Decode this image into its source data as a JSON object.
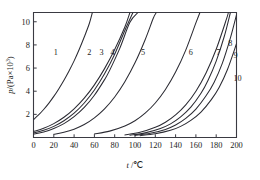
{
  "figure": {
    "name": "vapour-pressure-vs-temperature-chart",
    "background": "#ffffff",
    "curve_color": "#2b2b33",
    "axis_color": "#3a3a42"
  },
  "chart_data": {
    "type": "line",
    "title": "",
    "subtitle": "",
    "xlabel": "t /℃",
    "ylabel": "p/(Pa×10³)",
    "xlabel_symbol": "t",
    "xlabel_unit": "℃",
    "ylabel_symbol": "p",
    "ylabel_unit": "Pa×10³",
    "ylabel_mantissa": "p/(Pa×10",
    "ylabel_exponent": "3",
    "ylabel_close": ")",
    "xlim": [
      0,
      200
    ],
    "ylim": [
      0,
      10.8
    ],
    "grid": false,
    "legend": "none",
    "xticks": [
      0,
      20,
      40,
      60,
      80,
      100,
      120,
      140,
      160,
      180,
      200
    ],
    "xtick_labels": [
      "0",
      "20",
      "40",
      "60",
      "80",
      "100",
      "120",
      "140",
      "160",
      "180",
      "200"
    ],
    "yticks": [
      2,
      4,
      6,
      8,
      10
    ],
    "ytick_labels": [
      "2",
      "4",
      "6",
      "8",
      "10"
    ],
    "series": [
      {
        "name": "1",
        "label": "1",
        "label_x": 22,
        "label_y": 7.35,
        "points": [
          [
            0,
            1.55
          ],
          [
            5,
            1.95
          ],
          [
            10,
            2.42
          ],
          [
            15,
            2.95
          ],
          [
            20,
            3.55
          ],
          [
            25,
            4.22
          ],
          [
            30,
            4.95
          ],
          [
            35,
            5.75
          ],
          [
            40,
            6.62
          ],
          [
            45,
            7.6
          ],
          [
            50,
            8.68
          ],
          [
            55,
            9.85
          ],
          [
            58,
            10.8
          ]
        ]
      },
      {
        "name": "2",
        "label": "2",
        "label_x": 55,
        "label_y": 7.35,
        "points": [
          [
            0,
            0.52
          ],
          [
            10,
            0.8
          ],
          [
            20,
            1.2
          ],
          [
            30,
            1.75
          ],
          [
            40,
            2.48
          ],
          [
            50,
            3.4
          ],
          [
            60,
            4.55
          ],
          [
            70,
            5.95
          ],
          [
            80,
            7.6
          ],
          [
            90,
            9.55
          ],
          [
            95,
            10.8
          ]
        ]
      },
      {
        "name": "3",
        "label": "3",
        "label_x": 67,
        "label_y": 7.35,
        "points": [
          [
            0,
            0.4
          ],
          [
            10,
            0.62
          ],
          [
            20,
            0.96
          ],
          [
            30,
            1.45
          ],
          [
            40,
            2.1
          ],
          [
            50,
            2.98
          ],
          [
            60,
            4.1
          ],
          [
            70,
            5.5
          ],
          [
            80,
            7.2
          ],
          [
            90,
            9.25
          ],
          [
            98,
            10.8
          ]
        ]
      },
      {
        "name": "4",
        "label": "4",
        "label_x": 78,
        "label_y": 7.35,
        "points": [
          [
            0,
            0.3
          ],
          [
            10,
            0.48
          ],
          [
            20,
            0.78
          ],
          [
            30,
            1.2
          ],
          [
            40,
            1.8
          ],
          [
            50,
            2.6
          ],
          [
            60,
            3.65
          ],
          [
            70,
            5.0
          ],
          [
            75,
            5.8
          ],
          [
            85,
            7.7
          ],
          [
            95,
            9.95
          ],
          [
            103,
            10.8
          ]
        ]
      },
      {
        "name": "5",
        "label": "5",
        "label_x": 108,
        "label_y": 7.35,
        "points": [
          [
            20,
            0.28
          ],
          [
            30,
            0.45
          ],
          [
            40,
            0.72
          ],
          [
            50,
            1.12
          ],
          [
            60,
            1.7
          ],
          [
            70,
            2.48
          ],
          [
            80,
            3.5
          ],
          [
            90,
            4.82
          ],
          [
            100,
            6.45
          ],
          [
            110,
            8.45
          ],
          [
            118,
            10.3
          ],
          [
            121,
            10.8
          ]
        ]
      },
      {
        "name": "6",
        "label": "6",
        "label_x": 155,
        "label_y": 7.35,
        "points": [
          [
            60,
            0.3
          ],
          [
            75,
            0.55
          ],
          [
            90,
            1.0
          ],
          [
            100,
            1.45
          ],
          [
            110,
            2.1
          ],
          [
            120,
            2.98
          ],
          [
            130,
            4.15
          ],
          [
            140,
            5.65
          ],
          [
            150,
            7.55
          ],
          [
            160,
            9.9
          ],
          [
            164,
            10.8
          ]
        ]
      },
      {
        "name": "7",
        "label": "7",
        "label_x": 182,
        "label_y": 7.35,
        "points": [
          [
            90,
            0.22
          ],
          [
            105,
            0.45
          ],
          [
            120,
            0.88
          ],
          [
            130,
            1.32
          ],
          [
            140,
            1.95
          ],
          [
            150,
            2.82
          ],
          [
            160,
            4.0
          ],
          [
            170,
            5.58
          ],
          [
            180,
            7.62
          ],
          [
            190,
            10.2
          ],
          [
            192,
            10.8
          ]
        ]
      },
      {
        "name": "8",
        "label": "8",
        "label_x": 194,
        "label_y": 8.15,
        "points": [
          [
            95,
            0.2
          ],
          [
            110,
            0.4
          ],
          [
            125,
            0.78
          ],
          [
            135,
            1.18
          ],
          [
            145,
            1.78
          ],
          [
            155,
            2.62
          ],
          [
            165,
            3.82
          ],
          [
            172,
            4.95
          ],
          [
            180,
            6.6
          ],
          [
            188,
            8.75
          ],
          [
            194,
            10.8
          ]
        ]
      },
      {
        "name": "9",
        "label": "9",
        "label_x": 199,
        "label_y": 7.15,
        "points": [
          [
            100,
            0.18
          ],
          [
            115,
            0.36
          ],
          [
            130,
            0.7
          ],
          [
            140,
            1.08
          ],
          [
            150,
            1.65
          ],
          [
            160,
            2.45
          ],
          [
            170,
            3.6
          ],
          [
            178,
            4.78
          ],
          [
            186,
            6.4
          ],
          [
            194,
            8.6
          ],
          [
            200,
            10.6
          ]
        ]
      },
      {
        "name": "10",
        "label": "10",
        "label_x": 201,
        "label_y": 5.1,
        "points": [
          [
            105,
            0.16
          ],
          [
            120,
            0.32
          ],
          [
            135,
            0.62
          ],
          [
            145,
            0.96
          ],
          [
            155,
            1.48
          ],
          [
            165,
            2.2
          ],
          [
            175,
            3.25
          ],
          [
            183,
            4.35
          ],
          [
            191,
            5.85
          ],
          [
            200,
            8.1
          ]
        ]
      }
    ]
  }
}
